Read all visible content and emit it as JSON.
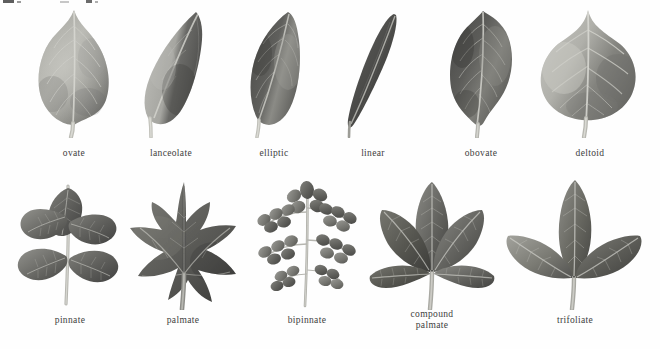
{
  "plate": {
    "title": "leaf shapes and arrangements reference plate",
    "background_color": "#ffffff",
    "caption_color": "#3d3d3d",
    "rows": [
      {
        "name": "simple-leaf-shapes",
        "items": [
          {
            "id": "ovate",
            "label": "ovate",
            "shape": "ovate",
            "tone_light": "#b9b9b4",
            "tone_mid": "#8f8f8a",
            "tone_dark": "#5f5f5c"
          },
          {
            "id": "lanceolate",
            "label": "lanceolate",
            "shape": "lanceolate",
            "tone_light": "#b2b2ad",
            "tone_mid": "#868682",
            "tone_dark": "#4c4c49"
          },
          {
            "id": "elliptic",
            "label": "elliptic",
            "shape": "elliptic",
            "tone_light": "#8e8e8a",
            "tone_mid": "#6a6a67",
            "tone_dark": "#3d3d3b"
          },
          {
            "id": "linear",
            "label": "linear",
            "shape": "linear",
            "tone_light": "#7a7a77",
            "tone_mid": "#585856",
            "tone_dark": "#3a3a38"
          },
          {
            "id": "obovate",
            "label": "obovate",
            "shape": "obovate",
            "tone_light": "#7e7e7a",
            "tone_mid": "#5c5c59",
            "tone_dark": "#3a3a38"
          },
          {
            "id": "deltoid",
            "label": "deltoid",
            "shape": "deltoid",
            "tone_light": "#b5b5b0",
            "tone_mid": "#8b8b86",
            "tone_dark": "#5e5e5a"
          }
        ]
      },
      {
        "name": "compound-leaf-arrangements",
        "items": [
          {
            "id": "pinnate",
            "label": "pinnate",
            "shape": "pinnate",
            "tone_light": "#8c8c88",
            "tone_mid": "#636360",
            "tone_dark": "#3c3c3a"
          },
          {
            "id": "palmate",
            "label": "palmate",
            "shape": "palmate",
            "tone_light": "#8a8a86",
            "tone_mid": "#5e5e5b",
            "tone_dark": "#3a3a38"
          },
          {
            "id": "bipinnate",
            "label": "bipinnate",
            "shape": "bipinnate",
            "tone_light": "#9c9c97",
            "tone_mid": "#76766f",
            "tone_dark": "#4e4e4a"
          },
          {
            "id": "compound-palmate",
            "label": "compound\npalmate",
            "shape": "compound-palmate",
            "tone_light": "#8f8f8a",
            "tone_mid": "#66665f",
            "tone_dark": "#414140"
          },
          {
            "id": "trifoliate",
            "label": "trifoliate",
            "shape": "trifoliate",
            "tone_light": "#93938e",
            "tone_mid": "#6b6b66",
            "tone_dark": "#434341"
          }
        ]
      }
    ]
  },
  "captions": {
    "ovate": "ovate",
    "lanceolate": "lanceolate",
    "elliptic": "elliptic",
    "linear": "linear",
    "obovate": "obovate",
    "deltoid": "deltoid",
    "pinnate": "pinnate",
    "palmate": "palmate",
    "bipinnate": "bipinnate",
    "compound_palmate_line1": "compound",
    "compound_palmate_line2": "palmate",
    "trifoliate": "trifoliate"
  }
}
